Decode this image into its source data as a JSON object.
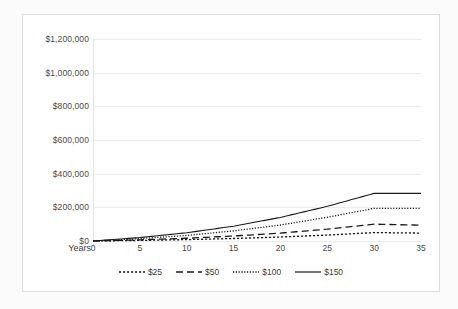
{
  "chart_data": {
    "type": "line",
    "title": "",
    "subtitle": "",
    "xlabel": "Years",
    "ylabel": "",
    "xlim": [
      0,
      35
    ],
    "ylim": [
      0,
      1200000
    ],
    "grid": true,
    "legend_position": "bottom",
    "x_ticks": [
      "0",
      "5",
      "10",
      "15",
      "20",
      "25",
      "30",
      "35"
    ],
    "x_tick_values": [
      0,
      5,
      10,
      15,
      20,
      25,
      30,
      35
    ],
    "y_ticks": [
      "$0",
      "$200,000",
      "$400,000",
      "$600,000",
      "$800,000",
      "$1,000,000",
      "$1,200,000"
    ],
    "y_tick_values": [
      0,
      200000,
      400000,
      600000,
      800000,
      1000000,
      1200000
    ],
    "x": [
      0,
      5,
      10,
      15,
      20,
      25,
      30,
      35
    ],
    "series": [
      {
        "name": "$25",
        "style": "fine-dashed",
        "color": "#1a1a1a",
        "values": [
          0,
          3400,
          8200,
          14800,
          23600,
          35200,
          50000,
          47000
        ]
      },
      {
        "name": "$50",
        "style": "long-dashed",
        "color": "#1a1a1a",
        "values": [
          0,
          6800,
          16400,
          29600,
          47200,
          70400,
          100000,
          94000
        ]
      },
      {
        "name": "$100",
        "style": "dotted",
        "color": "#1a1a1a",
        "values": [
          0,
          14000,
          33000,
          60000,
          95000,
          141000,
          194000,
          194000
        ]
      },
      {
        "name": "$150",
        "style": "solid",
        "color": "#1a1a1a",
        "values": [
          0,
          20500,
          49000,
          88000,
          140000,
          206000,
          283000,
          283000
        ]
      }
    ]
  },
  "axis": {
    "x_title": "Years"
  },
  "legend": {
    "items": [
      {
        "label": "$25",
        "style": "fine-dashed"
      },
      {
        "label": "$50",
        "style": "long-dashed"
      },
      {
        "label": "$100",
        "style": "dotted"
      },
      {
        "label": "$150",
        "style": "solid"
      }
    ]
  },
  "colors": {
    "frame_border": "#dcdcdc",
    "gridline": "#ececec",
    "text": "#4a4a4a",
    "line": "#1a1a1a",
    "background": "#ffffff"
  }
}
